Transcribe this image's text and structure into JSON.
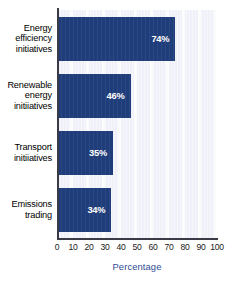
{
  "chart_data": {
    "type": "bar",
    "orientation": "horizontal",
    "title": "",
    "xlabel": "Percentage",
    "ylabel": "",
    "categories": [
      "Energy efficiency initiatives",
      "Renewable energy initiatives",
      "Transport initiatives",
      "Emissions trading"
    ],
    "values": [
      74,
      46,
      35,
      34
    ],
    "value_labels": [
      "74%",
      "46%",
      "35%",
      "34%"
    ],
    "xlim": [
      0,
      100
    ],
    "xticks": [
      0,
      10,
      20,
      30,
      40,
      50,
      60,
      70,
      80,
      90,
      100
    ],
    "xtick_labels": [
      "0",
      "10",
      "20",
      "30",
      "40",
      "50",
      "60",
      "70",
      "80",
      "90",
      "100"
    ],
    "grid": true,
    "grid_axis": "x",
    "legend": false,
    "bar_color": "#1f3d7a",
    "plot_background": "#f2f3fb",
    "label_color": "#ffffff",
    "axis_title_color": "#2e4d96"
  },
  "category_lines": [
    [
      "Energy",
      "efficiency",
      "initiatives"
    ],
    [
      "Renewable",
      "energy",
      "initiiatives"
    ],
    [
      "Transport",
      "initiiatives"
    ],
    [
      "Emissions",
      "trading"
    ]
  ]
}
